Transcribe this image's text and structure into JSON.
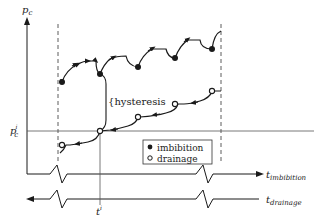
{
  "diagram": {
    "y_axis": {
      "label": "p",
      "label_sub": "c"
    },
    "x_axes": [
      {
        "label": "t",
        "label_sub": "imbibition",
        "direction": "right"
      },
      {
        "label": "t",
        "label_sub": "drainage",
        "direction": "left"
      }
    ],
    "reference": {
      "pressure_label": "p",
      "pressure_sub": "c",
      "pressure_sup": "i",
      "time_label": "t",
      "time_sup": "i"
    },
    "annotation": {
      "hysteresis_label": "hysteresis"
    },
    "legend": {
      "items": [
        {
          "marker": "filled-circle",
          "label": "imbibition"
        },
        {
          "marker": "open-circle",
          "label": "drainage"
        }
      ]
    },
    "colors": {
      "line": "#1a1a1a",
      "background": "#ffffff",
      "grid": "#555555"
    }
  }
}
